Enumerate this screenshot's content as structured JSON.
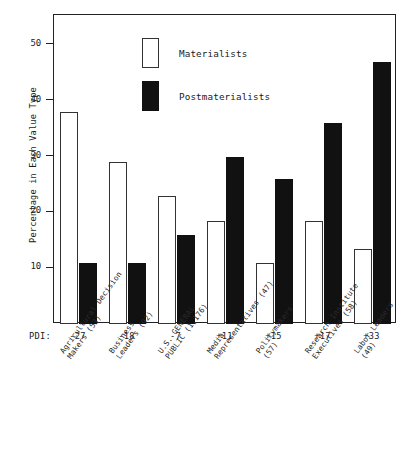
{
  "chart_data": {
    "type": "bar",
    "title": "",
    "xlabel": "",
    "ylabel": "Percentage in Each Value Type",
    "ylim": [
      0,
      55
    ],
    "yticks": [
      10,
      20,
      30,
      40,
      50
    ],
    "grid": false,
    "legend_position": "top-center",
    "categories": [
      "Agricultural Decision\nMakers (53)",
      "Business\nLeaders (92)",
      "U.S. GENERAL\nPUBLIC (1,176)",
      "Media\nRepresentatives (47)",
      "Policymakers\n(57)",
      "Research Institute\nExecutives (58)",
      "Labor Leaders\n(49)"
    ],
    "series": [
      {
        "name": "Materialists",
        "values": [
          38,
          29,
          23,
          18.5,
          11,
          18.5,
          13.5
        ],
        "color": "#ffffff"
      },
      {
        "name": "Postmaterialists",
        "values": [
          11,
          11,
          16,
          30,
          26,
          36,
          47
        ],
        "color": "#111111"
      }
    ],
    "secondary_axis": {
      "label": "PDI:",
      "values": [
        "-27",
        "-18",
        "-7",
        "+11",
        "+15",
        "+17",
        "+33"
      ]
    }
  },
  "axis": {
    "ytick_labels": [
      "50",
      "40",
      "30",
      "20",
      "10"
    ],
    "ytitle": "Percentage in Each Value Type"
  },
  "legend": {
    "items": [
      {
        "label": "Materialists",
        "swatch": "white-rect-swatch"
      },
      {
        "label": "Postmaterialists",
        "swatch": "black-rect-swatch"
      }
    ]
  },
  "pdi": {
    "label": "PDI:",
    "values": [
      "-27",
      "-18",
      "-7",
      "+11",
      "+15",
      "+17",
      "+33"
    ]
  },
  "categories": [
    {
      "line1": "Agricultural Decision",
      "line2": "Makers (53)"
    },
    {
      "line1": "Business",
      "line2": "Leaders (92)"
    },
    {
      "line1": "U.S. GENERAL",
      "line2": "PUBLIC (1,176)"
    },
    {
      "line1": "Media",
      "line2": "Representatives (47)"
    },
    {
      "line1": "Policymakers",
      "line2": "(57)"
    },
    {
      "line1": "Research Institute",
      "line2": "Executives (58)"
    },
    {
      "line1": "Labor Leaders",
      "line2": "(49)"
    }
  ]
}
